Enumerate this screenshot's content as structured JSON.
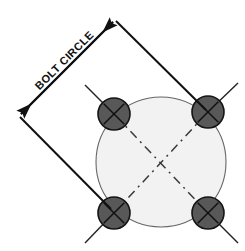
{
  "drawing": {
    "title_label": "BOLT CIRCLE",
    "canvas": {
      "width": 245,
      "height": 251,
      "background": "#ffffff"
    },
    "colors": {
      "background": "#ffffff",
      "bolt_fill": "#585858",
      "bolt_stroke": "#1a1a1a",
      "bolt_cross": "#111111",
      "plate_fill": "#f2f2f2",
      "plate_stroke": "#555555",
      "dimension_line": "#111111",
      "centerline": "#444444",
      "label_text": "#111111"
    },
    "plate": {
      "name": "bolt-circle-plate",
      "center_x": 161,
      "center_y": 162,
      "radius": 65
    },
    "bolts": [
      {
        "id": "bolt-top-left",
        "cx": 114,
        "cy": 114,
        "r": 16,
        "marker": "x-cross"
      },
      {
        "id": "bolt-top-right",
        "cx": 208,
        "cy": 112,
        "r": 16,
        "marker": "x-cross"
      },
      {
        "id": "bolt-bottom-left",
        "cx": 114,
        "cy": 213,
        "r": 16,
        "marker": "x-cross"
      },
      {
        "id": "bolt-bottom-right",
        "cx": 208,
        "cy": 213,
        "r": 16,
        "marker": "x-cross"
      }
    ],
    "dimension": {
      "name": "bolt-circle-diameter-dimension",
      "label": "BOLT CIRCLE",
      "label_rotation_deg": -45,
      "arrow_start_x": 19,
      "arrow_start_y": 115,
      "arrow_end_x": 115,
      "arrow_end_y": 20,
      "style": "double-arrow-diagonal"
    },
    "extension_lines": [
      {
        "id": "extension-line-upper",
        "x1": 115,
        "y1": 20,
        "x2": 207,
        "y2": 110
      },
      {
        "id": "extension-line-lower",
        "x1": 19,
        "y1": 115,
        "x2": 112,
        "y2": 211
      }
    ],
    "centerlines": [
      {
        "id": "centerline-diagonal-a",
        "style": "dashed"
      },
      {
        "id": "centerline-diagonal-b",
        "style": "dashed"
      }
    ]
  }
}
